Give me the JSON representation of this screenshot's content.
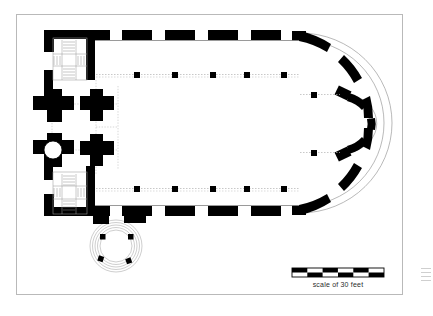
{
  "document": {
    "type": "architectural-floor-plan",
    "subject": "church-plan",
    "description": "Black and white architectural ground plan of a church with apsidal east end, twin west stair towers, central crossing with cruciform piers and a circular stair, two nave arcades of square piers, and a circular chapel projecting south."
  },
  "frame": {
    "border_color": "#b9b9b9",
    "background": "#ffffff",
    "x": 16,
    "y": 14,
    "width": 387,
    "height": 281
  },
  "scale_bar": {
    "caption": "scale of 30 feet",
    "x": 292,
    "y": 268,
    "width": 92,
    "height": 9,
    "segments": 6,
    "rows": 2,
    "fill_color": "#000000",
    "gap_color": "#ffffff",
    "border_color": "#000000"
  },
  "plan": {
    "wall_color": "#000000",
    "opening_color": "#ffffff",
    "dotted_color": "#a8a8a8",
    "hatch_color": "#8a8a8a",
    "arc_color": "#9a9a9a",
    "north_wall": {
      "y": 33,
      "x_start": 95,
      "x_end": 300,
      "thickness": 9,
      "blocks": [
        {
          "x": 95,
          "w": 22
        },
        {
          "x": 129,
          "w": 30
        },
        {
          "x": 172,
          "w": 30
        },
        {
          "x": 215,
          "w": 30
        },
        {
          "x": 258,
          "w": 30
        },
        {
          "x": 296,
          "w": 10
        }
      ]
    },
    "south_wall": {
      "y": 205,
      "x_start": 95,
      "x_end": 300,
      "thickness": 9,
      "blocks": [
        {
          "x": 95,
          "w": 22
        },
        {
          "x": 129,
          "w": 30
        },
        {
          "x": 172,
          "w": 30
        },
        {
          "x": 215,
          "w": 30
        },
        {
          "x": 258,
          "w": 30
        },
        {
          "x": 296,
          "w": 10
        }
      ]
    },
    "west_wall": {
      "x": 44,
      "y_start": 33,
      "y_end": 214,
      "thickness": 8
    },
    "apse": {
      "center_x": 300,
      "center_y": 123,
      "radius_outer": 92,
      "radius_inner": 84,
      "note": "Large rounded east end formed by a broad curve with dashed masonry blocks, with a smaller secondary semicircular apse projecting at the far east."
    },
    "crossing": {
      "center_x": 72,
      "center_y": 123,
      "piers": [
        {
          "name": "northwest-pier",
          "cx": 50,
          "cy": 103,
          "cruciform": true
        },
        {
          "name": "northeast-pier",
          "cx": 95,
          "cy": 103,
          "cruciform": true
        },
        {
          "name": "southwest-pier",
          "cx": 50,
          "cy": 151,
          "cruciform": true,
          "has_circular_stair": true
        },
        {
          "name": "southeast-pier",
          "cx": 95,
          "cy": 151,
          "cruciform": true
        }
      ],
      "circular_stair": {
        "cx": 53,
        "cy": 152,
        "r": 9
      }
    },
    "towers": [
      {
        "name": "northwest-stair-tower",
        "x": 48,
        "y": 36,
        "width": 46,
        "height": 44,
        "hatch": "stair-treads"
      },
      {
        "name": "southwest-stair-tower",
        "x": 48,
        "y": 172,
        "width": 46,
        "height": 44,
        "hatch": "stair-treads"
      }
    ],
    "arcades": [
      {
        "name": "north-arcade",
        "y": 75,
        "pier_size": 5,
        "piers_x": [
          137,
          175,
          213,
          247,
          284,
          316
        ]
      },
      {
        "name": "south-arcade",
        "y": 189,
        "pier_size": 5,
        "piers_x": [
          137,
          175,
          213,
          247,
          284,
          316
        ]
      }
    ],
    "south_chapel": {
      "name": "circular-chapel",
      "cx": 116,
      "cy": 246,
      "radius": 26,
      "concentric_rings": 5,
      "piers": [
        {
          "cx": 103,
          "cy": 237
        },
        {
          "cx": 131,
          "cy": 237
        },
        {
          "cx": 101,
          "cy": 259
        },
        {
          "cx": 128,
          "cy": 261
        }
      ]
    }
  }
}
